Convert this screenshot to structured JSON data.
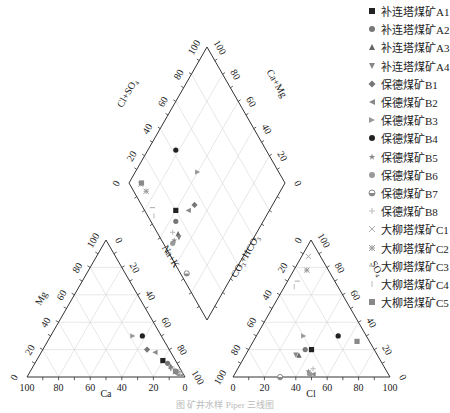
{
  "chart_data": {
    "type": "scatter",
    "subtype": "piper-trilinear",
    "title": "",
    "caption": "图 矿井水样 Piper 三线图",
    "axes": {
      "cation_triangle": {
        "left_label": "Mg",
        "bottom_label": "Ca",
        "right_label": "Na+K",
        "ticks": [
          0,
          20,
          40,
          60,
          80,
          100
        ]
      },
      "anion_triangle": {
        "left_label": "CO3+HCO3",
        "bottom_label": "Cl",
        "right_label": "SO4",
        "ticks": [
          0,
          20,
          40,
          60,
          80,
          100
        ]
      },
      "diamond": {
        "upper_left_label": "Cl+SO4",
        "upper_right_label": "Ca+Mg",
        "lower_left_label": "Na+K",
        "lower_right_label": "CO3+HCO3",
        "ticks": [
          0,
          20,
          40,
          60,
          80,
          100
        ]
      }
    },
    "grid": true,
    "legend_position": "upper-right",
    "series": [
      {
        "name": "补连塔煤矿A1",
        "marker": "square",
        "color": "#222222",
        "cation": {
          "Ca": 8,
          "Mg": 12
        },
        "anion": {
          "Cl": 40,
          "SO4": 20
        }
      },
      {
        "name": "补连塔煤矿A2",
        "marker": "circle",
        "color": "#777777",
        "cation": {
          "Ca": 6,
          "Mg": 10
        },
        "anion": {
          "Cl": 36,
          "SO4": 20
        }
      },
      {
        "name": "补连塔煤矿A3",
        "marker": "triangle-up",
        "color": "#666666",
        "cation": {
          "Ca": 5,
          "Mg": 8
        },
        "anion": {
          "Cl": 34,
          "SO4": 16
        }
      },
      {
        "name": "补连塔煤矿A4",
        "marker": "triangle-down",
        "color": "#888888",
        "cation": {
          "Ca": 6,
          "Mg": 6
        },
        "anion": {
          "Cl": 32,
          "SO4": 16
        }
      },
      {
        "name": "保德煤矿B1",
        "marker": "diamond",
        "color": "#777777",
        "cation": {
          "Ca": 14,
          "Mg": 20
        },
        "anion": {
          "Cl": 48,
          "SO4": 2
        }
      },
      {
        "name": "保德煤矿B2",
        "marker": "triangle-left",
        "color": "#888888",
        "cation": {
          "Ca": 10,
          "Mg": 18
        },
        "anion": {
          "Cl": 50,
          "SO4": 2
        }
      },
      {
        "name": "保德煤矿B3",
        "marker": "triangle-right",
        "color": "#999999",
        "cation": {
          "Ca": 18,
          "Mg": 30
        },
        "anion": {
          "Cl": 30,
          "SO4": 30
        }
      },
      {
        "name": "保德煤矿B4",
        "marker": "circle",
        "color": "#222222",
        "cation": {
          "Ca": 12,
          "Mg": 30
        },
        "anion": {
          "Cl": 52,
          "SO4": 30
        }
      },
      {
        "name": "保德煤矿B5",
        "marker": "star",
        "color": "#888888",
        "cation": {
          "Ca": 4,
          "Mg": 4
        },
        "anion": {
          "Cl": 46,
          "SO4": 4
        }
      },
      {
        "name": "保德煤矿B6",
        "marker": "circle",
        "color": "#999999",
        "cation": {
          "Ca": 3,
          "Mg": 3
        },
        "anion": {
          "Cl": 48,
          "SO4": 2
        }
      },
      {
        "name": "保德煤矿B7",
        "marker": "half-circle",
        "color": "#888888",
        "cation": {
          "Ca": 2,
          "Mg": 2
        },
        "anion": {
          "Cl": 30,
          "SO4": 0
        }
      },
      {
        "name": "保德煤矿B8",
        "marker": "plus",
        "color": "#bbbbbb",
        "cation": {
          "Ca": 4,
          "Mg": 6
        },
        "anion": {
          "Cl": 48,
          "SO4": 6
        }
      },
      {
        "name": "大柳塔煤矿C1",
        "marker": "x",
        "color": "#aaaaaa",
        "cation": {
          "Ca": 3,
          "Mg": 4
        },
        "anion": {
          "Cl": 4,
          "SO4": 88
        }
      },
      {
        "name": "大柳塔煤矿C2",
        "marker": "asterisk",
        "color": "#999999",
        "cation": {
          "Ca": 4,
          "Mg": 4
        },
        "anion": {
          "Cl": 8,
          "SO4": 78
        }
      },
      {
        "name": "大柳塔煤矿C3",
        "marker": "dash",
        "color": "#aaaaaa",
        "cation": {
          "Ca": 3,
          "Mg": 3
        },
        "anion": {
          "Cl": 6,
          "SO4": 70
        }
      },
      {
        "name": "大柳塔煤矿C4",
        "marker": "vline",
        "color": "#bbbbbb",
        "cation": {
          "Ca": 2,
          "Mg": 2
        },
        "anion": {
          "Cl": 6,
          "SO4": 66
        }
      },
      {
        "name": "大柳塔煤矿C5",
        "marker": "square",
        "color": "#888888",
        "cation": {
          "Ca": 4,
          "Mg": 4
        },
        "anion": {
          "Cl": 66,
          "SO4": 26
        }
      }
    ]
  },
  "legend": {
    "items": [
      {
        "label": "补连塔煤矿A1"
      },
      {
        "label": "补连塔煤矿A2"
      },
      {
        "label": "补连塔煤矿A3"
      },
      {
        "label": "补连塔煤矿A4"
      },
      {
        "label": "保德煤矿B1"
      },
      {
        "label": "保德煤矿B2"
      },
      {
        "label": "保德煤矿B3"
      },
      {
        "label": "保德煤矿B4"
      },
      {
        "label": "保德煤矿B5"
      },
      {
        "label": "保德煤矿B6"
      },
      {
        "label": "保德煤矿B7"
      },
      {
        "label": "保德煤矿B8"
      },
      {
        "label": "大柳塔煤矿C1"
      },
      {
        "label": "大柳塔煤矿C2"
      },
      {
        "label": "大柳塔煤矿C3"
      },
      {
        "label": "大柳塔煤矿C4"
      },
      {
        "label": "大柳塔煤矿C5"
      }
    ]
  },
  "labels": {
    "mg": "Mg",
    "ca": "Ca",
    "nak": "Na+K",
    "cl": "Cl",
    "so4": "SO",
    "so4_sub": "4",
    "clso4": "Cl+SO",
    "clso4_sub": "4",
    "camg": "Ca+Mg",
    "co3": "CO",
    "co3_sub": "3",
    "co3_mid": "+HCO",
    "co3_sub2": "3",
    "caption": "图 矿井水样 Piper 三线图"
  }
}
